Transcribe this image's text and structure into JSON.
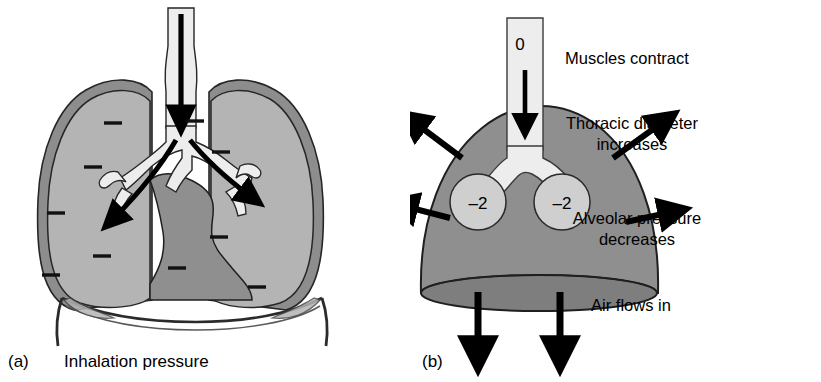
{
  "figure": {
    "background": "#ffffff"
  },
  "colors": {
    "lung_fill": "#b4b4b4",
    "pleura_rim": "#8d8d8d",
    "mediastinum": "#8f8f8f",
    "dome_fill": "#8f8f8f",
    "dome_base": "#7e7e7e",
    "airway_fill": "#ededed",
    "alveolus_fill": "#cfcfcf",
    "outline": "#1a1a1a",
    "arrow": "#000000",
    "text": "#000000"
  },
  "panel_a": {
    "letter": "(a)",
    "caption": "Inhalation pressure",
    "negative_pressure_marks": {
      "symbol": "–",
      "count": 10,
      "left_lung": 5,
      "right_lung": 5
    },
    "arrows": [
      {
        "name": "trachea-inflow-arrow",
        "direction": "down"
      },
      {
        "name": "left-bronchus-airflow-arrow",
        "direction": "down-left"
      },
      {
        "name": "right-bronchus-airflow-arrow",
        "direction": "down-right"
      }
    ]
  },
  "panel_b": {
    "letter": "(b)",
    "trachea_pressure": "0",
    "alveolar_pressure_left": "–2",
    "alveolar_pressure_right": "–2",
    "annotations": [
      {
        "name": "muscles-contract",
        "lines": [
          "Muscles contract"
        ]
      },
      {
        "name": "thoracic-diameter",
        "lines": [
          "Thoracic diameter",
          "increases"
        ]
      },
      {
        "name": "alveolar-pressure",
        "lines": [
          "Alveolar pressure",
          "decreases"
        ]
      },
      {
        "name": "air-flows-in",
        "lines": [
          "Air flows in"
        ]
      }
    ],
    "arrows": [
      {
        "name": "trachea-inflow-arrow",
        "direction": "down"
      },
      {
        "name": "expansion-arrow-upper-left",
        "direction": "up-left"
      },
      {
        "name": "expansion-arrow-upper-right",
        "direction": "up-right"
      },
      {
        "name": "expansion-arrow-lower-left",
        "direction": "left"
      },
      {
        "name": "expansion-arrow-lower-right",
        "direction": "right"
      },
      {
        "name": "diaphragm-descent-arrow-left",
        "direction": "down"
      },
      {
        "name": "diaphragm-descent-arrow-right",
        "direction": "down"
      }
    ]
  }
}
